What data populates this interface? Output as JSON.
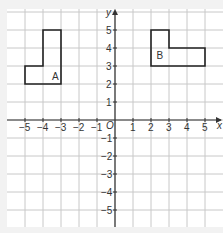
{
  "diagram": {
    "type": "coordinate-grid",
    "x_axis_label": "x",
    "y_axis_label": "y",
    "origin_label": "O",
    "x_ticks": [
      "-5",
      "-4",
      "-3",
      "-2",
      "-1",
      "1",
      "2",
      "3",
      "4",
      "5"
    ],
    "y_ticks": [
      "5",
      "4",
      "3",
      "2",
      "1",
      "-1",
      "-2",
      "-3",
      "-4",
      "-5"
    ],
    "shapes": [
      {
        "label": "A",
        "vertices": [
          [
            -5,
            2
          ],
          [
            -3,
            2
          ],
          [
            -3,
            5
          ],
          [
            -4,
            5
          ],
          [
            -4,
            3
          ],
          [
            -5,
            3
          ]
        ]
      },
      {
        "label": "B",
        "vertices": [
          [
            2,
            3
          ],
          [
            5,
            3
          ],
          [
            5,
            4
          ],
          [
            3,
            4
          ],
          [
            3,
            5
          ],
          [
            2,
            5
          ]
        ]
      }
    ],
    "colors": {
      "background": "#f2f2f2",
      "grid_bg": "#ffffff",
      "grid_line": "#c8c8c8",
      "axis": "#333333",
      "shape": "#222222"
    }
  }
}
